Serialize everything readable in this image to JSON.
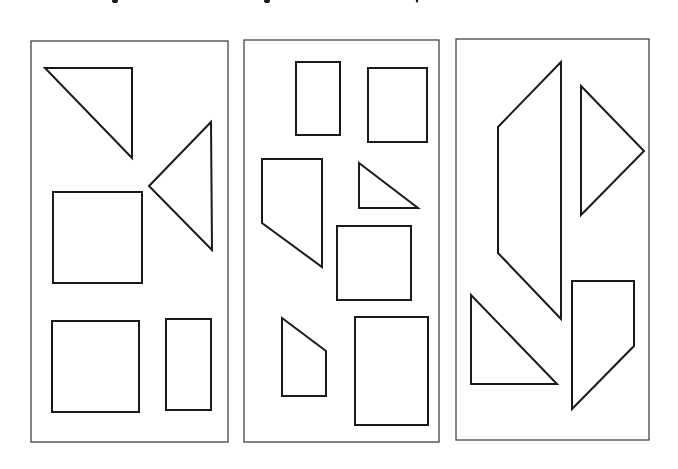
{
  "figure": {
    "stroke_color": "#1a1a1a",
    "frame_color": "#444444",
    "background": "#ffffff",
    "panels": [
      {
        "id": "panel-1",
        "label": "Panel 1",
        "frame": {
          "x": 31,
          "y": 41,
          "w": 197,
          "h": 401
        },
        "title_mark": {
          "x": 115,
          "y": 0
        },
        "shapes": [
          {
            "type": "right-triangle",
            "points": "45,68 132,68 132,158"
          },
          {
            "type": "triangle",
            "points": "211,122 149,186 212,250"
          },
          {
            "type": "square",
            "points": "53,192 142,192 142,283 53,283"
          },
          {
            "type": "square",
            "points": "52,321 139,321 139,412 52,412"
          },
          {
            "type": "rectangle",
            "points": "166,319 211,319 211,410 166,410"
          }
        ]
      },
      {
        "id": "panel-2",
        "label": "Panel 2",
        "frame": {
          "x": 244,
          "y": 40,
          "w": 195,
          "h": 402
        },
        "title_mark": {
          "x": 267,
          "y": 0
        },
        "shapes": [
          {
            "type": "rectangle",
            "points": "296,62 340,62 340,135 296,135"
          },
          {
            "type": "square",
            "points": "368,68 427,68 427,142 368,142"
          },
          {
            "type": "trapezoid",
            "points": "262,159 322,159 322,267 262,223"
          },
          {
            "type": "right-triangle",
            "points": "359,163 359,208 418,208"
          },
          {
            "type": "square",
            "points": "337,226 411,226 411,300 337,300"
          },
          {
            "type": "quadrilateral",
            "points": "282,318 326,351 326,396 282,396"
          },
          {
            "type": "rectangle",
            "points": "355,317 428,317 428,425 355,425"
          }
        ]
      },
      {
        "id": "panel-3",
        "label": "Panel 3",
        "frame": {
          "x": 456,
          "y": 39,
          "w": 193,
          "h": 401
        },
        "title_mark": {
          "x": 417,
          "y": 0
        },
        "shapes": [
          {
            "type": "quadrilateral",
            "points": "561,62 561,319 498,253 498,127"
          },
          {
            "type": "triangle",
            "points": "581,86 644,151 581,215"
          },
          {
            "type": "right-triangle",
            "points": "471,295 471,384 557,384"
          },
          {
            "type": "quadrilateral",
            "points": "572,281 634,281 634,346 572,409"
          }
        ]
      }
    ]
  }
}
